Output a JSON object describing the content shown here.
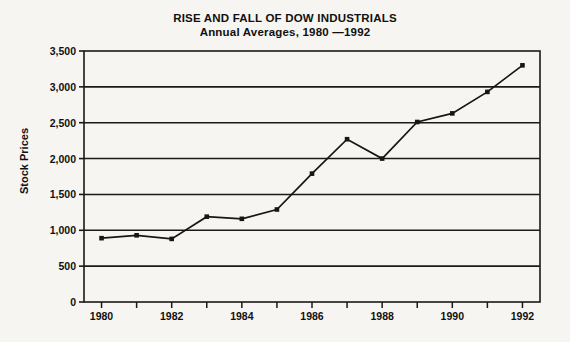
{
  "chart_data": {
    "type": "line",
    "title": "RISE AND FALL OF DOW INDUSTRIALS",
    "subtitle": "Annual Averages, 1980 —1992",
    "xlabel": "",
    "ylabel": "Stock Prices",
    "x": [
      1980,
      1981,
      1982,
      1983,
      1984,
      1985,
      1986,
      1987,
      1988,
      1989,
      1990,
      1991,
      1992
    ],
    "values": [
      890,
      930,
      880,
      1190,
      1160,
      1290,
      1790,
      2270,
      2000,
      2510,
      2630,
      2930,
      3300
    ],
    "xlim": [
      1979.5,
      1992.5
    ],
    "ylim": [
      0,
      3500
    ],
    "ytick_values": [
      0,
      500,
      1000,
      1500,
      2000,
      2500,
      3000,
      3500
    ],
    "ytick_labels": [
      "0",
      "500",
      "1,000",
      "1,500",
      "2,000",
      "2,500",
      "3,000",
      "3,500"
    ],
    "xtick_values": [
      1980,
      1981,
      1982,
      1983,
      1984,
      1985,
      1986,
      1987,
      1988,
      1989,
      1990,
      1991,
      1992
    ],
    "xtick_labeled": [
      1980,
      1982,
      1984,
      1986,
      1988,
      1990,
      1992
    ],
    "xtick_labels": [
      "1980",
      "1982",
      "1984",
      "1986",
      "1988",
      "1990",
      "1992"
    ],
    "grid": "horizontal",
    "legend": "none",
    "marker": "square",
    "line_color": "#161616",
    "background_color": "#f6f5f1",
    "axis_color": "#1a1a1a"
  }
}
